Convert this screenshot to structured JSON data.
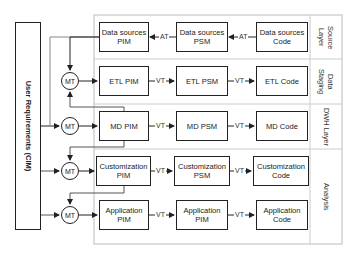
{
  "diagram": {
    "cim_label": "User Requirements (CIM)",
    "layers": [
      {
        "label": "Source\nLayer"
      },
      {
        "label": "Data\nStaging"
      },
      {
        "label": "DWH Layer"
      },
      {
        "label": "Analysis"
      }
    ],
    "rows": [
      {
        "pim": "Data sources\nPIM",
        "psm": "Data sources\nPSM",
        "code": "Data sources\nCode",
        "t1": "AT",
        "t2": "AT"
      },
      {
        "pim": "ETL PIM",
        "psm": "ETL PSM",
        "code": "ETL Code",
        "t1": "VT",
        "t2": "VT"
      },
      {
        "pim": "MD PIM",
        "psm": "MD PSM",
        "code": "MD Code",
        "t1": "VT",
        "t2": "VT"
      },
      {
        "pim": "Customization\nPIM",
        "psm": "Customization\nPSM",
        "code": "Customization\nCode",
        "t1": "VT",
        "t2": "VT"
      },
      {
        "pim": "Application\nPIM",
        "psm": "Application\nPIM",
        "code": "Application\nCode",
        "t1": "VT",
        "t2": "VT"
      }
    ],
    "mt_label": "MT",
    "colors": {
      "line": "#222222",
      "frame": "#bbbbbb",
      "separator": "#cccccc"
    }
  }
}
